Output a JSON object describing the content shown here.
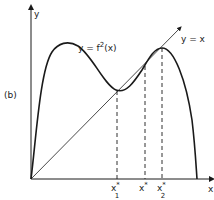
{
  "figure": {
    "panel_label": "(b)",
    "axes": {
      "x_label": "x",
      "y_label": "y"
    },
    "curve_label": {
      "prefix": "y = f",
      "sup": "2",
      "suffix": "(x)"
    },
    "diagonal_label": "y = x",
    "fixed_points": [
      {
        "base": "x",
        "star": "*",
        "sub": "1"
      },
      {
        "base": "x",
        "star": "*",
        "sub": ""
      },
      {
        "base": "x",
        "star": "*",
        "sub": "2"
      }
    ],
    "colors": {
      "ink": "#1a1a1a",
      "background": "#ffffff"
    }
  }
}
